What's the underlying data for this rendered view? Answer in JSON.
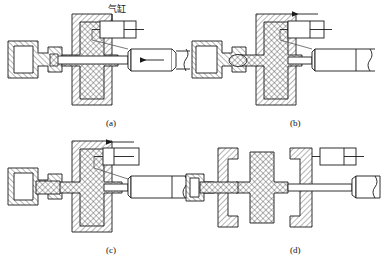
{
  "figure": {
    "kind": "engineering-sectional-diagram",
    "panels_count": 4,
    "stroke_color": "#1a1a1a",
    "hatch_color": "#2b2b2b",
    "background": "#ffffff"
  },
  "annotations": {
    "cylinder_label": "气缸",
    "cylinder_label_meaning": "air cylinder"
  },
  "panels": [
    {
      "id": "a",
      "caption": "(a)",
      "state": "mold closed, part formed in cavity, cylinder rod fully extended left",
      "arrow_in_rod": "left",
      "symbol_piston_position": "right",
      "symbol_has_top_arrow": false
    },
    {
      "id": "b",
      "caption": "(b)",
      "state": "mold partially open, core retracting, rod begins to withdraw",
      "arrow_in_rod": "none",
      "symbol_piston_position": "center",
      "symbol_has_top_arrow": true,
      "top_arrow_direction": "left"
    },
    {
      "id": "c",
      "caption": "(c)",
      "state": "core pulled further, part released from side core",
      "arrow_in_rod": "none",
      "symbol_piston_position": "center-left",
      "symbol_has_top_arrow": true,
      "top_arrow_direction": "left"
    },
    {
      "id": "d",
      "caption": "(d)",
      "state": "mold fully open, cross-shaped part free between halves",
      "arrow_in_rod": "none",
      "symbol_piston_position": "right",
      "symbol_has_top_arrow": false
    }
  ],
  "legend": {
    "diagonal_hatch": "mold steel / die block section",
    "cross_hatch": "molded part section",
    "plain_outline": "pneumatic cylinder body and rod"
  }
}
